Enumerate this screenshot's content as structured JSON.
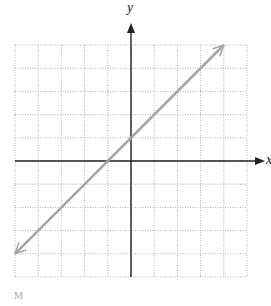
{
  "chart_data": {
    "type": "line",
    "title": "",
    "xlabel": "x",
    "ylabel": "y",
    "xlim": [
      -5,
      5
    ],
    "ylim": [
      -5,
      5
    ],
    "grid": true,
    "grid_style": "dotted",
    "series": [
      {
        "name": "y = x + 1",
        "x": [
          -5,
          4
        ],
        "y": [
          -4,
          5
        ],
        "arrows": "both",
        "color": "#a6a6a6"
      }
    ],
    "marked_points": [
      [
        -1,
        0
      ],
      [
        0,
        1
      ]
    ]
  },
  "labels": {
    "x_axis": "x",
    "y_axis": "y",
    "caption": "M"
  },
  "colors": {
    "grid": "#b0b0b0",
    "axis": "#222222",
    "line": "#a6a6a6"
  }
}
